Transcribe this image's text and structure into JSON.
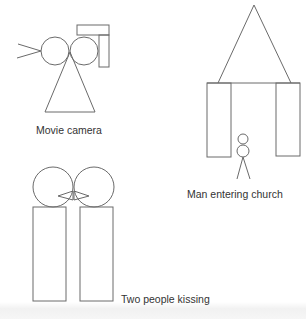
{
  "figures": [
    {
      "id": "movie-camera",
      "label": "Movie camera"
    },
    {
      "id": "man-entering-church",
      "label": "Man entering church"
    },
    {
      "id": "two-people-kissing",
      "label": "Two people kissing"
    }
  ],
  "colors": {
    "stroke": "#666666",
    "text": "#333333",
    "background": "#ffffff"
  }
}
